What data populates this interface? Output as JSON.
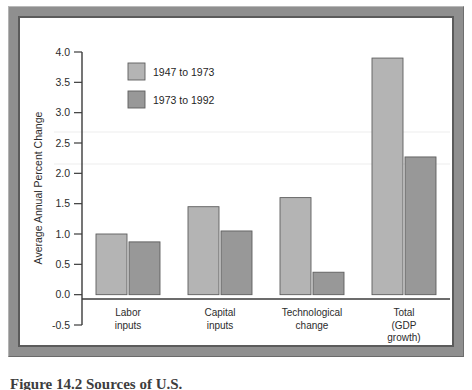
{
  "figure": {
    "caption": "Figure 14.2  Sources of U.S."
  },
  "chart_data": {
    "type": "bar",
    "title": "",
    "xlabel": "",
    "ylabel": "Average Annual Percent Change",
    "categories": [
      "Labor\ninputs",
      "Capital\ninputs",
      "Technological\nchange",
      "Total\n(GDP\ngrowth)"
    ],
    "category_lines": [
      [
        "Labor",
        "inputs"
      ],
      [
        "Capital",
        "inputs"
      ],
      [
        "Technological",
        "change"
      ],
      [
        "Total",
        "(GDP",
        "growth)"
      ]
    ],
    "series": [
      {
        "name": "1947 to 1973",
        "color": "#b4b4b4",
        "values": [
          1.0,
          1.45,
          1.6,
          3.9
        ]
      },
      {
        "name": "1973 to 1992",
        "color": "#989898",
        "values": [
          0.87,
          1.05,
          0.37,
          2.27
        ]
      }
    ],
    "ylim": [
      -0.5,
      4.0
    ],
    "ytick_values": [
      -0.5,
      0.0,
      0.5,
      1.0,
      1.5,
      2.0,
      2.5,
      3.0,
      3.5,
      4.0
    ],
    "ytick_labels": [
      "-0.5",
      "0.0",
      "0.5",
      "1.0",
      "1.5",
      "2.0",
      "2.5",
      "3.0",
      "3.5",
      "4.0"
    ],
    "grid": false,
    "legend_position": "upper-left-inside"
  },
  "legend": {
    "entries": [
      {
        "label": "1947 to 1973",
        "color": "#b4b4b4"
      },
      {
        "label": "1973 to 1992",
        "color": "#989898"
      }
    ]
  },
  "colors": {
    "series_1": "#b4b4b4",
    "series_2": "#989898",
    "bar_outline": "#5e5e5e",
    "axis": "#3b3b3b",
    "frame_outer": "#8f8f8f",
    "frame_inner": "#5b5b5b",
    "plate": "#ffffff"
  }
}
